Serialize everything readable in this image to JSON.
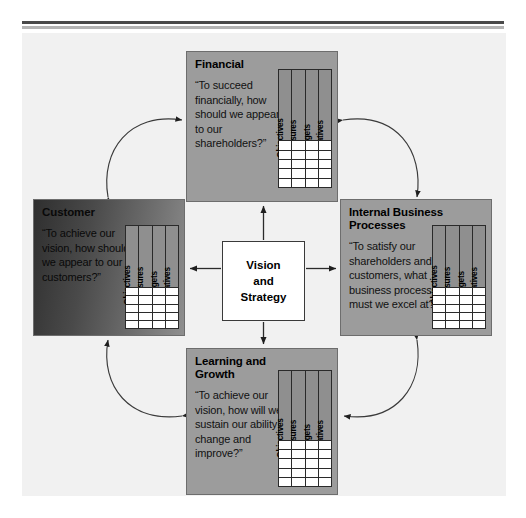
{
  "diagram": {
    "background_color": "#f1f1f1",
    "panel_color": "#9c9c9c",
    "accent_rule_color": "#4a4a4a"
  },
  "center": {
    "name": "vision-and-strategy",
    "lines": [
      "Vision",
      "and",
      "Strategy"
    ]
  },
  "table_columns": [
    "Objectives",
    "Measures",
    "Targets",
    "Initiatives"
  ],
  "perspectives": {
    "financial": {
      "title": "Financial",
      "quote": "“To succeed financially, how should we appear to our shareholders?”",
      "row_count": 5
    },
    "customer": {
      "title": "Customer",
      "quote": "“To achieve our vision, how should we appear to our customers?”",
      "row_count": 5
    },
    "internal": {
      "title": "Internal Business Processes",
      "quote": "“To satisfy our shareholders and customers, what business processes must we excel at?”",
      "row_count": 5
    },
    "learning": {
      "title": "Learning and Growth",
      "quote": "“To achieve our vision, how will we sustain our ability to change and improve?”",
      "row_count": 5
    }
  },
  "connectors": {
    "center_to_financial": "arrow-up",
    "center_to_customer": "arrow-left",
    "center_to_internal": "arrow-right",
    "center_to_learning": "arrow-down",
    "customer_financial_arc": "double-headed",
    "financial_internal_arc": "double-headed",
    "internal_learning_arc": "double-headed",
    "learning_customer_arc": "double-headed"
  }
}
